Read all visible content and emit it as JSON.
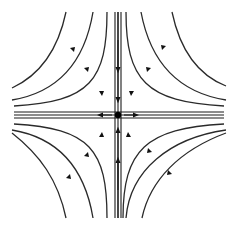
{
  "diagram": {
    "type": "phase-portrait",
    "kind": "saddle-point",
    "equilibrium": {
      "x": 118,
      "y": 115,
      "label": ""
    },
    "colors": {
      "line": "#2a2a2a",
      "arrow": "#111111",
      "background": "#ffffff"
    },
    "manifolds": {
      "stable": "vertical (arrows point toward center)",
      "unstable": "horizontal (arrows point away from center)"
    },
    "trajectory_count_per_quadrant": 3
  }
}
